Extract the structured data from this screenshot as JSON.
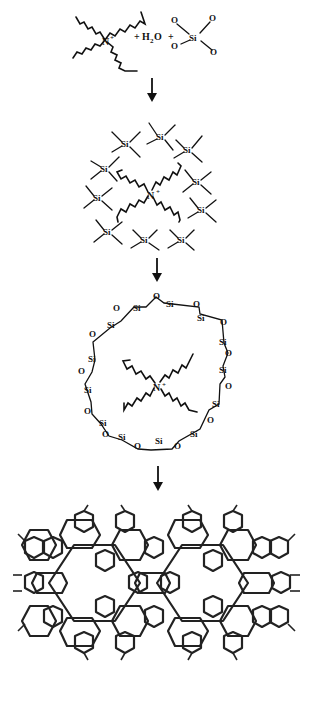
{
  "diagram": {
    "type": "reaction-scheme",
    "flow": "top-to-bottom",
    "steps": [
      {
        "id": "reactants",
        "cation_label": "N",
        "cation_charge": "+",
        "plus_1": "+",
        "water": "H",
        "water_sub": "2",
        "water_tail": "O",
        "plus_2": "+",
        "silicate_center": "Si",
        "silicate_ligand": "O"
      },
      {
        "id": "templated-cluster",
        "cation_label": "N",
        "cation_charge": "+",
        "unit_label": "Si"
      },
      {
        "id": "silicate-ring-around-template",
        "cation_label": "N",
        "cation_charge": "+",
        "ring_si": "Si",
        "ring_o": "O"
      },
      {
        "id": "zeolite-framework",
        "description": "extended cage framework"
      }
    ],
    "arrows": 4,
    "colors": {
      "ink": "#111111",
      "background": "#ffffff"
    }
  }
}
